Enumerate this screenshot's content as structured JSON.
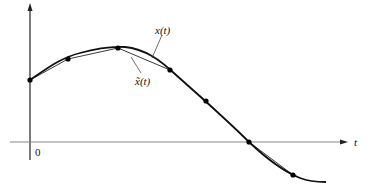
{
  "diagram": {
    "title": "",
    "labels": {
      "curve": "x(t)",
      "approx": "x̃(t)",
      "axis_t": "t",
      "origin": "0"
    },
    "colors": {
      "curve": "#111111",
      "approx": "#222222",
      "axis": "#222222",
      "axis_h": "#888888",
      "points": "#000000"
    },
    "sample_points": [
      [
        30,
        80
      ],
      [
        68,
        59
      ],
      [
        118,
        48
      ],
      [
        170,
        70
      ],
      [
        206,
        101
      ],
      [
        249,
        142
      ],
      [
        293,
        175
      ]
    ]
  }
}
